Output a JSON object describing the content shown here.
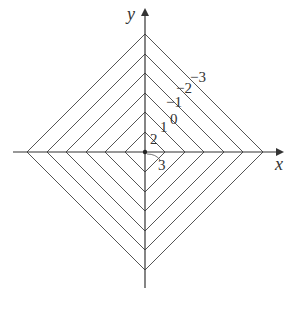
{
  "figure": {
    "type": "level-curves",
    "axes": {
      "x_label": "x",
      "y_label": "y"
    },
    "origin_px": [
      145,
      152
    ],
    "diamond_radii_px": [
      20,
      40,
      59,
      79,
      98,
      118
    ],
    "level_labels": [
      {
        "text": "3",
        "x": 158,
        "y": 170
      },
      {
        "text": "2",
        "x": 150,
        "y": 144
      },
      {
        "text": "1",
        "x": 160,
        "y": 132
      },
      {
        "text": "0",
        "x": 170,
        "y": 124
      },
      {
        "text": "−1",
        "x": 166,
        "y": 107
      },
      {
        "text": "−2",
        "x": 176,
        "y": 93
      },
      {
        "text": "−3",
        "x": 190,
        "y": 82
      }
    ],
    "colors": {
      "line": "#555555",
      "axis": "#333333",
      "text": "#333333"
    }
  }
}
